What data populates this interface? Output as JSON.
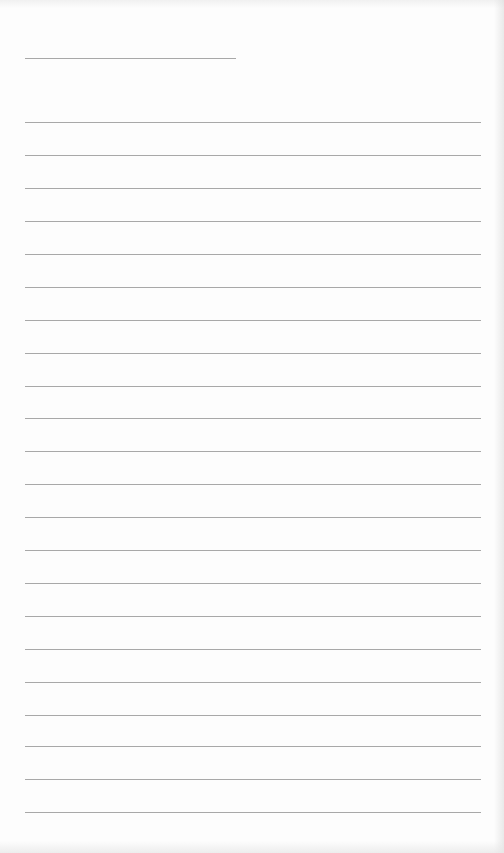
{
  "document": {
    "type": "lined-paper",
    "line_color": "#a8a8a8",
    "background_color": "#fdfdfd",
    "header_line": {
      "x": 25,
      "y": 58,
      "width": 211
    },
    "ruled_lines": {
      "x": 25,
      "width": 456,
      "y_positions": [
        122,
        155,
        188,
        221,
        254,
        287,
        320,
        353,
        386,
        418,
        451,
        484,
        517,
        550,
        583,
        616,
        649,
        682,
        715,
        746,
        779,
        812
      ]
    }
  }
}
